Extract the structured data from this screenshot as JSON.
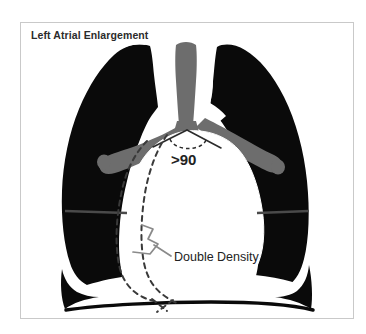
{
  "figure": {
    "title": "Left Atrial Enlargement",
    "kind": "chest-radiograph-schematic",
    "frame": {
      "border_color": "#c9c9c9",
      "background_color": "#ffffff"
    }
  },
  "annotations": {
    "carina_angle": {
      "label": ">90",
      "meaning": "widened carinal angle greater than 90 degrees",
      "color": "#222222"
    },
    "double_density": {
      "label": "Double Density",
      "meaning": "double density sign at right heart border",
      "color": "#222222",
      "leader_color": "#8a8a8a"
    }
  },
  "anatomy": {
    "lung_fields": {
      "name": "lung-fields",
      "color": "#0a0a0a"
    },
    "trachea_bronchi": {
      "name": "trachea-and-main-bronchi",
      "color": "#6d6d6d"
    },
    "cardiomediastinal_silhouette": {
      "name": "cardiomediastinal-silhouette",
      "color": "#ffffff"
    },
    "diaphragm": {
      "name": "diaphragm",
      "color": "#ffffff"
    },
    "horizontal_fissure_line": {
      "name": "horizontal-band",
      "color": "#4a4a4a"
    },
    "dashed_atrial_border": {
      "name": "dashed-left-atrial-border",
      "color": "#3a3a3a",
      "style": "dashed"
    }
  }
}
